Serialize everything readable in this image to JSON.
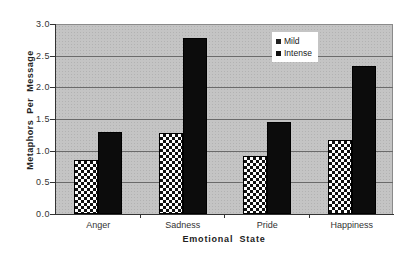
{
  "chart_data": {
    "type": "bar",
    "title": "",
    "xlabel": "Emotional State",
    "ylabel": "Metaphors Per Message",
    "categories": [
      "Anger",
      "Sadness",
      "Pride",
      "Happiness"
    ],
    "series": [
      {
        "name": "Mild",
        "values": [
          0.85,
          1.28,
          0.92,
          1.17
        ],
        "pattern": "checkerboard",
        "color": "#ffffff"
      },
      {
        "name": "Intense",
        "values": [
          1.3,
          2.78,
          1.45,
          2.34
        ],
        "pattern": "solid",
        "color": "#0c0c0c"
      }
    ],
    "ylim": [
      0.0,
      3.0
    ],
    "yticks": [
      "0.0",
      "0.5",
      "1.0",
      "1.5",
      "2.0",
      "2.5",
      "3.0"
    ],
    "grid": true,
    "legend_position": "upper-right-inside",
    "plot_background": "#c4c4c4"
  },
  "legend": {
    "items": [
      {
        "label": "Mild",
        "color": "#222222"
      },
      {
        "label": "Intense",
        "color": "#111111"
      }
    ]
  }
}
